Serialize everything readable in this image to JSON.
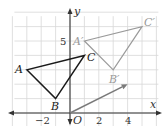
{
  "diagram": {
    "type": "coordinate-plane-translation",
    "axes": {
      "x_label": "x",
      "y_label": "y",
      "origin_label": "O",
      "x_ticks": [
        {
          "value": -2,
          "label": "−2"
        },
        {
          "value": 2,
          "label": "2"
        },
        {
          "value": 4,
          "label": "4"
        }
      ],
      "y_ticks": [
        {
          "value": 5,
          "label": "5"
        }
      ],
      "x_range": [
        -4,
        6
      ],
      "y_range": [
        -1,
        7
      ],
      "grid": true
    },
    "original_triangle": {
      "color": "#1a1a1a",
      "vertices": [
        {
          "name": "A",
          "x": -3,
          "y": 3
        },
        {
          "name": "B",
          "x": -1,
          "y": 1
        },
        {
          "name": "C",
          "x": 1,
          "y": 4
        }
      ]
    },
    "image_triangle": {
      "color": "#9a9a9a",
      "vertices": [
        {
          "name": "A′",
          "x": 1,
          "y": 5
        },
        {
          "name": "B′",
          "x": 3,
          "y": 3
        },
        {
          "name": "C′",
          "x": 5,
          "y": 6
        }
      ]
    },
    "translation_vector": {
      "color": "#7a7a7a",
      "from": {
        "x": 0,
        "y": 0
      },
      "to": {
        "x": 4,
        "y": 2
      }
    },
    "colors": {
      "grid": "#d8d8d8",
      "axis": "#333333"
    }
  }
}
